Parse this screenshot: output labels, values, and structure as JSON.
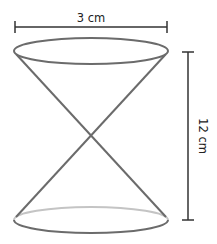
{
  "diagram": {
    "type": "double-cone",
    "width_label": "3 cm",
    "height_label": "12 cm",
    "colors": {
      "outline": "#6b6b6b",
      "hidden_edge": "#c4c4c4",
      "dimension": "#333333",
      "text": "#222222"
    }
  }
}
